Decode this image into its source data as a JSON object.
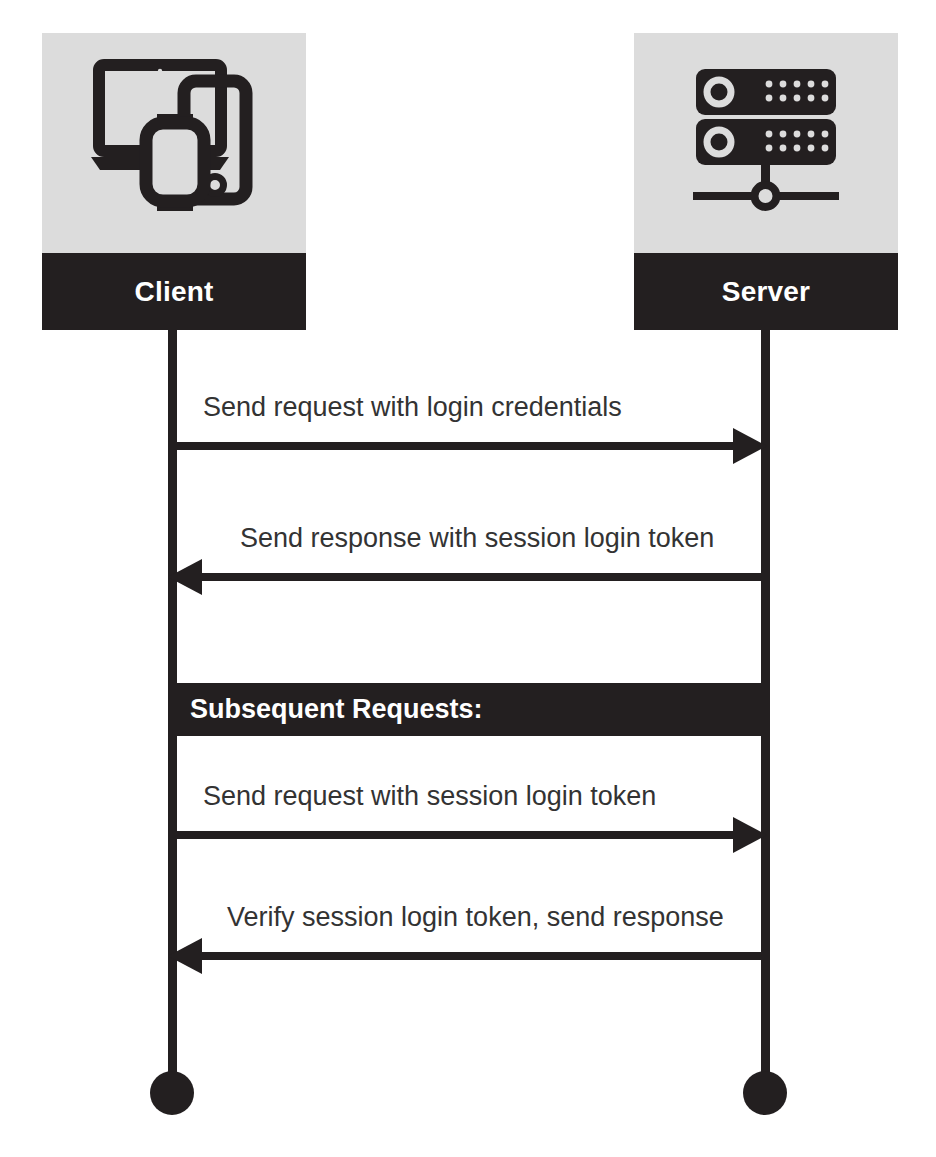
{
  "diagram": {
    "type": "sequence-diagram",
    "participants": [
      {
        "id": "client",
        "label": "Client",
        "icon": "devices-icon"
      },
      {
        "id": "server",
        "label": "Server",
        "icon": "server-rack-icon"
      }
    ],
    "messages": [
      {
        "label": "Send request with login credentials",
        "from": "client",
        "to": "server",
        "direction": "right"
      },
      {
        "label": "Send response with session login token",
        "from": "server",
        "to": "client",
        "direction": "left"
      },
      {
        "label": "Send request with session login token",
        "from": "client",
        "to": "server",
        "direction": "right"
      },
      {
        "label": "Verify session login token, send response",
        "from": "server",
        "to": "client",
        "direction": "left"
      }
    ],
    "section_banner": {
      "label": "Subsequent Requests:"
    },
    "colors": {
      "ink": "#231f20",
      "card_background": "#dcdcdc",
      "page_background": "#ffffff",
      "label_text": "#333333",
      "banner_text": "#ffffff"
    }
  }
}
